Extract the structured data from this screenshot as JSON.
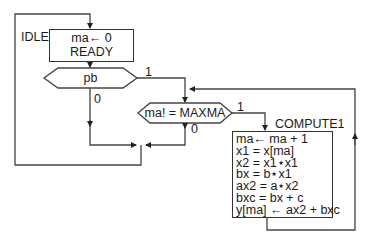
{
  "diagram": {
    "type": "ASM chart",
    "line_color": "#333333",
    "states": [
      {
        "name": "IDLE",
        "lines": [
          "ma← 0",
          "READY"
        ]
      },
      {
        "name": "COMPUTE1",
        "lines": [
          "ma← ma + 1",
          "x1 = x[ma]",
          "x2 = x1⋆x1",
          "bx = b⋆x1",
          "ax2 = a⋆x2",
          "bxc = bx + c",
          "y[ma] ← ax2 + bxc"
        ]
      }
    ],
    "decisions": [
      {
        "condition": "pb",
        "true_label": "1",
        "false_label": "0"
      },
      {
        "condition": "ma! = MAXMA",
        "true_label": "1",
        "false_label": "0"
      }
    ]
  }
}
